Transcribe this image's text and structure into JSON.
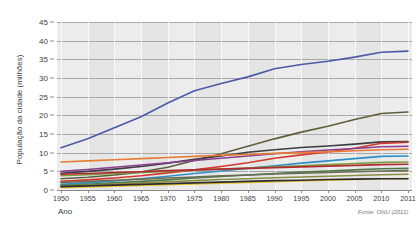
{
  "chart_data": {
    "type": "line",
    "title": "Crescimento populacional das cidades, 1950-2011",
    "xlabel": "Ano",
    "ylabel": "População da cidade (milhões)",
    "source": "Fonte: ONU (2011).",
    "x": [
      1950,
      1955,
      1960,
      1965,
      1970,
      1975,
      1980,
      1985,
      1990,
      1995,
      2000,
      2005,
      2010,
      2011
    ],
    "x_tick_labels": [
      "1950",
      "1955",
      "1960",
      "1965",
      "1970",
      "1975",
      "1980",
      "1985",
      "1990",
      "1995",
      "2000",
      "2005",
      "2010",
      "2011"
    ],
    "y_tick_labels": [
      "0",
      "5",
      "10",
      "15",
      "20",
      "25",
      "30",
      "35",
      "40",
      "45"
    ],
    "ylim": [
      0,
      45
    ],
    "ytick_step": 5,
    "grid": true,
    "legend": "none",
    "series": [
      {
        "name": "serie-1",
        "color": "#4a5aa8",
        "values": [
          11.3,
          13.7,
          16.7,
          19.6,
          23.3,
          26.6,
          28.5,
          30.3,
          32.5,
          33.6,
          34.5,
          35.6,
          36.9,
          37.2
        ]
      },
      {
        "name": "serie-2",
        "color": "#5e5f3a",
        "values": [
          3.0,
          3.4,
          4.0,
          4.8,
          6.1,
          7.9,
          9.7,
          11.7,
          13.7,
          15.5,
          17.1,
          18.9,
          20.5,
          20.9
        ]
      },
      {
        "name": "serie-3",
        "color": "#3c3c44",
        "values": [
          4.5,
          5.0,
          5.6,
          6.3,
          7.2,
          8.2,
          9.1,
          10.1,
          10.8,
          11.4,
          11.8,
          12.3,
          12.9,
          13.0
        ]
      },
      {
        "name": "serie-4",
        "color": "#d4372c",
        "values": [
          2.3,
          2.7,
          3.2,
          3.8,
          4.6,
          5.4,
          6.3,
          7.3,
          8.5,
          9.4,
          10.2,
          11.2,
          12.5,
          12.8
        ]
      },
      {
        "name": "serie-5",
        "color": "#8d3f8f",
        "values": [
          5.0,
          5.5,
          6.1,
          6.7,
          7.3,
          7.9,
          8.5,
          9.1,
          9.7,
          10.2,
          10.7,
          11.1,
          11.6,
          11.7
        ]
      },
      {
        "name": "serie-6",
        "color": "#e87b35",
        "values": [
          7.5,
          7.8,
          8.1,
          8.4,
          8.7,
          9.0,
          9.3,
          9.5,
          9.8,
          10.0,
          10.2,
          10.5,
          10.8,
          10.9
        ]
      },
      {
        "name": "serie-7",
        "color": "#2f8fc9",
        "values": [
          1.5,
          1.9,
          2.4,
          3.0,
          3.7,
          4.4,
          5.1,
          5.8,
          6.5,
          7.2,
          7.8,
          8.4,
          9.0,
          9.1
        ]
      },
      {
        "name": "serie-8",
        "color": "#7aa13e",
        "values": [
          3.8,
          4.1,
          4.4,
          4.7,
          5.0,
          5.3,
          5.6,
          5.9,
          6.2,
          6.5,
          6.8,
          7.1,
          7.4,
          7.5
        ]
      },
      {
        "name": "serie-9",
        "color": "#b02a32",
        "values": [
          4.2,
          4.4,
          4.7,
          4.9,
          5.2,
          5.4,
          5.6,
          5.8,
          6.0,
          6.2,
          6.4,
          6.6,
          6.8,
          6.9
        ]
      },
      {
        "name": "serie-10",
        "color": "#4b7a4f",
        "values": [
          1.2,
          1.5,
          1.9,
          2.3,
          2.7,
          3.2,
          3.6,
          4.0,
          4.4,
          4.8,
          5.1,
          5.4,
          5.7,
          5.8
        ]
      },
      {
        "name": "serie-11",
        "color": "#6d6d52",
        "values": [
          2.0,
          2.3,
          2.6,
          2.9,
          3.2,
          3.5,
          3.8,
          4.0,
          4.3,
          4.5,
          4.7,
          4.9,
          5.1,
          5.2
        ]
      },
      {
        "name": "serie-12",
        "color": "#8a8f3f",
        "values": [
          1.0,
          1.3,
          1.6,
          1.9,
          2.2,
          2.5,
          2.8,
          3.0,
          3.3,
          3.5,
          3.7,
          3.9,
          4.1,
          4.2
        ]
      },
      {
        "name": "serie-13",
        "color": "#e8c22a",
        "values": [
          0.6,
          0.8,
          1.0,
          1.2,
          1.4,
          1.6,
          1.8,
          2.0,
          2.2,
          2.4,
          2.6,
          2.8,
          3.0,
          3.1
        ]
      },
      {
        "name": "serie-14",
        "color": "#2b2b30",
        "values": [
          0.9,
          1.1,
          1.3,
          1.5,
          1.7,
          1.9,
          2.1,
          2.3,
          2.5,
          2.6,
          2.8,
          2.9,
          3.0,
          3.0
        ]
      }
    ]
  }
}
